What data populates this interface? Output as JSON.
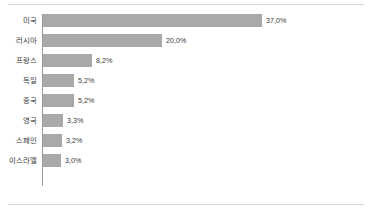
{
  "chart_data": {
    "type": "bar",
    "orientation": "horizontal",
    "title": "",
    "subtitle": "",
    "xlabel": "",
    "ylabel": "",
    "grid": false,
    "legend": null,
    "xlim": [
      0,
      40
    ],
    "value_suffix": "%",
    "categories": [
      "미국",
      "러시아",
      "프랑스",
      "독일",
      "중국",
      "영국",
      "스페인",
      "이스라엘"
    ],
    "values": [
      37.0,
      20.0,
      8.2,
      5.2,
      5.2,
      3.3,
      3.2,
      3.0
    ],
    "value_labels": [
      "37,0%",
      "20,0%",
      "8,2%",
      "5,2%",
      "5,2%",
      "3,3%",
      "3,2%",
      "3,0%"
    ],
    "bars": [
      {
        "label": "미국",
        "value": 37.0,
        "value_label": "37,0%"
      },
      {
        "label": "러시아",
        "value": 20.0,
        "value_label": "20,0%"
      },
      {
        "label": "프랑스",
        "value": 8.2,
        "value_label": "8,2%"
      },
      {
        "label": "독일",
        "value": 5.2,
        "value_label": "5,2%"
      },
      {
        "label": "중국",
        "value": 5.2,
        "value_label": "5,2%"
      },
      {
        "label": "영국",
        "value": 3.3,
        "value_label": "3,3%"
      },
      {
        "label": "스페인",
        "value": 3.2,
        "value_label": "3,2%"
      },
      {
        "label": "이스라엘",
        "value": 3.0,
        "value_label": "3,0%"
      }
    ],
    "colors": {
      "bar": "#a9a9a9",
      "axis": "#9a9a9a",
      "text": "#3a3a3a",
      "rule": "#d9d9d9",
      "background": "#ffffff"
    }
  }
}
